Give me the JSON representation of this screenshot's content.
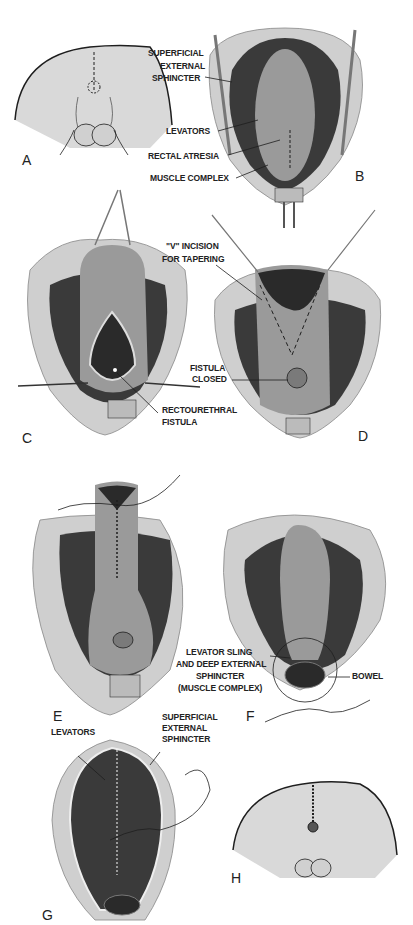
{
  "figure": {
    "panels": [
      {
        "id": "A",
        "letter": "A",
        "labels": []
      },
      {
        "id": "B",
        "letter": "B",
        "labels": [
          "SUPERFICIAL",
          "EXTERNAL",
          "SPHINCTER",
          "LEVATORS",
          "RECTAL ATRESIA",
          "MUSCLE COMPLEX"
        ]
      },
      {
        "id": "C",
        "letter": "C",
        "labels": [
          "RECTOURETHRAL",
          "FISTULA"
        ]
      },
      {
        "id": "D",
        "letter": "D",
        "labels": [
          "\"V\" INCISION",
          "FOR TAPERING",
          "FISTULA",
          "CLOSED"
        ]
      },
      {
        "id": "E",
        "letter": "E",
        "labels": []
      },
      {
        "id": "F",
        "letter": "F",
        "labels": [
          "LEVATOR SLING",
          "AND DEEP EXTERNAL",
          "SPHINCTER",
          "(MUSCLE COMPLEX)",
          "BOWEL"
        ]
      },
      {
        "id": "G",
        "letter": "G",
        "labels": [
          "LEVATORS",
          "SUPERFICIAL",
          "EXTERNAL",
          "SPHINCTER"
        ]
      },
      {
        "id": "H",
        "letter": "H",
        "labels": []
      }
    ]
  },
  "colors": {
    "skin": "#d9d9d9",
    "muscle": "#3a3a3a",
    "bowel": "#9a9a9a",
    "outline": "#1e1e1e",
    "tissue": "#eeeeee"
  }
}
